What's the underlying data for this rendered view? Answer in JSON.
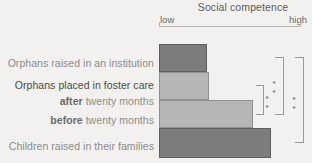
{
  "chart_data": {
    "type": "bar",
    "orientation": "horizontal",
    "title": "Social competence",
    "xlabel": "Social competence",
    "ylabel": "",
    "axis_min_label": "low",
    "axis_max_label": "high",
    "grid": false,
    "legend": "none",
    "categories": [
      "Orphans raised in an institution",
      "Orphans placed in foster care after twenty months",
      "Orphans placed in foster care before twenty months",
      "Children raised in their families"
    ],
    "values": [
      34,
      35,
      66,
      79
    ],
    "xlim": [
      0,
      100
    ],
    "colors": [
      "#7d7d7d",
      "#b6b6b6",
      "#b6b6b6",
      "#7d7d7d"
    ],
    "annotations": [
      {
        "label": "**",
        "compares": [
          "after twenty months",
          "before twenty months"
        ]
      },
      {
        "label": "**",
        "compares": [
          "Orphans raised in an institution",
          "before twenty months"
        ]
      },
      {
        "label": "**",
        "compares": [
          "Orphans raised in an institution",
          "Children raised in their families"
        ]
      }
    ]
  },
  "header": {
    "title": "Social competence",
    "low": "low",
    "high": "high"
  },
  "rows": [
    {
      "id": "institution",
      "label": "Orphans raised in an institution",
      "value": 34,
      "color": "dark"
    },
    {
      "id": "foster-after",
      "label": "Orphans placed in foster care",
      "value": 35,
      "color": "light"
    },
    {
      "id": "foster-after-sub",
      "label_em": "after",
      "label_rest": "twenty months"
    },
    {
      "id": "foster-before",
      "label_em": "before",
      "label_rest": "twenty months",
      "value": 66,
      "color": "light"
    },
    {
      "id": "families",
      "label": "Children raised in their families",
      "value": 79,
      "color": "dark"
    }
  ],
  "significance": {
    "mark_inner": "**",
    "mark_middle": "**",
    "mark_outer": "**"
  },
  "colors": {
    "dark_bar": "#7d7d7d",
    "light_bar": "#b6b6b6",
    "background": "#f2f1ef",
    "axis": "#b9b7b4",
    "label_muted": "#8c8c8c",
    "label_strong": "#4a4a4a"
  }
}
